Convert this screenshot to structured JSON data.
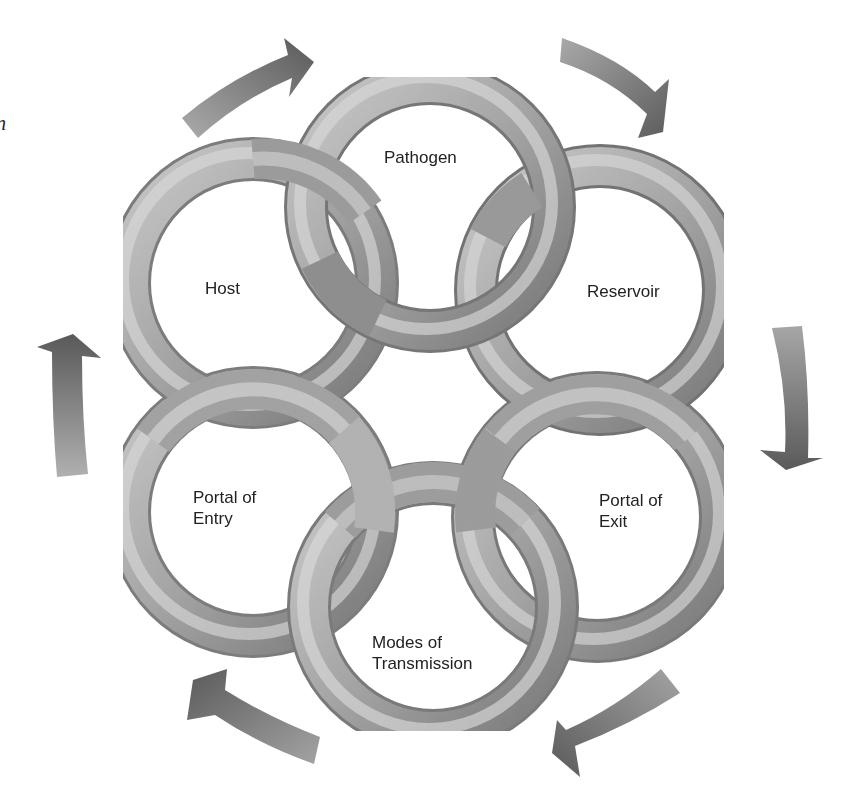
{
  "diagram": {
    "title": "",
    "edge_glyph": "n",
    "colors": {
      "background": "#ffffff",
      "ring_light": "#d9d9d9",
      "ring_mid": "#a9a9a9",
      "ring_dark": "#6e6e6e",
      "arrow_dark": "#5e5e5e",
      "arrow_light": "#a8a8a8",
      "label": "#222222"
    },
    "rings": [
      {
        "id": "pathogen",
        "label": "Pathogen",
        "cx": 430,
        "cy": 207
      },
      {
        "id": "reservoir",
        "label": "Reservoir",
        "cx": 600,
        "cy": 290
      },
      {
        "id": "portal-of-exit",
        "label": "Portal of\nExit",
        "cx": 597,
        "cy": 517
      },
      {
        "id": "modes-of-transmission",
        "label": "Modes of\nTransmission",
        "cx": 433,
        "cy": 607
      },
      {
        "id": "portal-of-entry",
        "label": "Portal of\nEntry",
        "cx": 253,
        "cy": 512
      },
      {
        "id": "host",
        "label": "Host",
        "cx": 253,
        "cy": 283
      }
    ],
    "labels": {
      "pathogen": "Pathogen",
      "reservoir": "Reservoir",
      "portal_of_exit": "Portal of\nExit",
      "modes_of_transmission": "Modes of\nTransmission",
      "portal_of_entry": "Portal of\nEntry",
      "host": "Host"
    },
    "cycle_order": [
      "Pathogen",
      "Reservoir",
      "Portal of Exit",
      "Modes of Transmission",
      "Portal of Entry",
      "Host"
    ],
    "arrows": [
      {
        "id": "arrow-host-to-pathogen",
        "from": "Host",
        "to": "Pathogen",
        "direction": "clockwise"
      },
      {
        "id": "arrow-pathogen-to-reservoir",
        "from": "Pathogen",
        "to": "Reservoir",
        "direction": "clockwise"
      },
      {
        "id": "arrow-reservoir-to-exit",
        "from": "Reservoir",
        "to": "Portal of Exit",
        "direction": "clockwise"
      },
      {
        "id": "arrow-exit-to-transmission",
        "from": "Portal of Exit",
        "to": "Modes of Transmission",
        "direction": "clockwise"
      },
      {
        "id": "arrow-transmission-to-entry",
        "from": "Modes of Transmission",
        "to": "Portal of Entry",
        "direction": "clockwise"
      },
      {
        "id": "arrow-entry-to-host",
        "from": "Portal of Entry",
        "to": "Host",
        "direction": "clockwise"
      }
    ]
  }
}
